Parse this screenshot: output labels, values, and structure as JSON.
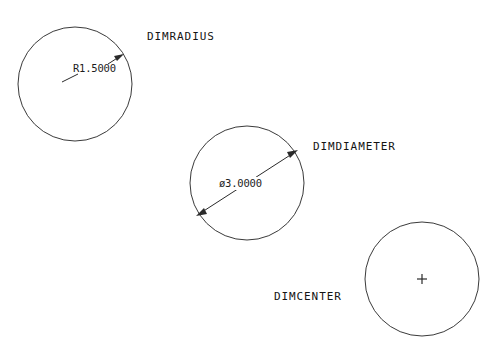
{
  "page": {
    "background_color": "#ffffff",
    "line_color": "#2a2a2a",
    "width": 495,
    "height": 341
  },
  "figures": [
    {
      "id": "radius-figure",
      "command_label": "DIMRADIUS",
      "dimension_text": "R1.5000",
      "circle": {
        "cx": 75,
        "cy": 84,
        "r": 57
      },
      "label_pos": {
        "x": 147,
        "y": 40
      },
      "text_pos": {
        "x": 73,
        "y": 72
      }
    },
    {
      "id": "diameter-figure",
      "command_label": "DIMDIAMETER",
      "dimension_text": "ø3.0000",
      "circle": {
        "cx": 247,
        "cy": 183,
        "r": 57
      },
      "label_pos": {
        "x": 313,
        "y": 150
      },
      "text_pos": {
        "x": 219,
        "y": 186
      }
    },
    {
      "id": "center-figure",
      "command_label": "DIMCENTER",
      "dimension_text": "+",
      "circle": {
        "cx": 422,
        "cy": 279,
        "r": 57
      },
      "label_pos": {
        "x": 274,
        "y": 300
      },
      "text_pos": {
        "x": 422,
        "y": 279
      }
    }
  ]
}
